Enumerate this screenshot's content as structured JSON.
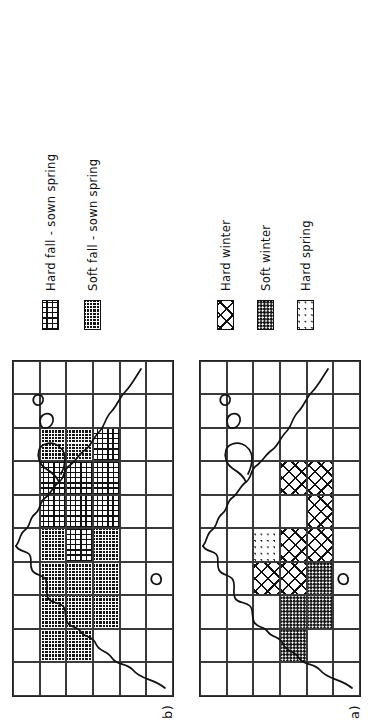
{
  "figure": {
    "orientation": "rotated-90-ccw",
    "panels": [
      {
        "id": "b",
        "label": "b)",
        "legend": [
          {
            "key": "hard_fall_sown_spring",
            "label": "Hard fall - sown spring",
            "pattern": "fine-grid"
          },
          {
            "key": "soft_fall_sown_spring",
            "label": "Soft fall - sown spring",
            "pattern": "dark-fine-grid"
          }
        ],
        "map": {
          "cols": 6,
          "rows": 10,
          "cells": [
            [
              "blank",
              "blank",
              "blank",
              "blank",
              "blank",
              "blank"
            ],
            [
              "blank",
              "soft_fall_sown_spring",
              "soft_fall_sown_spring",
              "blank",
              "blank",
              "blank"
            ],
            [
              "blank",
              "soft_fall_sown_spring",
              "soft_fall_sown_spring",
              "soft_fall_sown_spring",
              "blank",
              "blank"
            ],
            [
              "blank",
              "soft_fall_sown_spring",
              "soft_fall_sown_spring",
              "soft_fall_sown_spring",
              "blank",
              "blank"
            ],
            [
              "blank",
              "soft_fall_sown_spring",
              "hard_fall_sown_spring",
              "soft_fall_sown_spring",
              "blank",
              "blank"
            ],
            [
              "blank",
              "hard_fall_sown_spring",
              "hard_fall_sown_spring",
              "hard_fall_sown_spring",
              "blank",
              "blank"
            ],
            [
              "blank",
              "hard_fall_sown_spring",
              "hard_fall_sown_spring",
              "hard_fall_sown_spring",
              "blank",
              "blank"
            ],
            [
              "blank",
              "soft_fall_sown_spring",
              "soft_fall_sown_spring",
              "hard_fall_sown_spring",
              "blank",
              "blank"
            ],
            [
              "blank",
              "blank",
              "blank",
              "blank",
              "blank",
              "blank"
            ],
            [
              "blank",
              "blank",
              "blank",
              "blank",
              "blank",
              "blank"
            ]
          ]
        }
      },
      {
        "id": "a",
        "label": "a)",
        "legend": [
          {
            "key": "hard_winter",
            "label": "Hard winter",
            "pattern": "diagonal-cross"
          },
          {
            "key": "soft_winter",
            "label": "Soft winter",
            "pattern": "dark-stipple"
          },
          {
            "key": "hard_spring",
            "label": "Hard spring",
            "pattern": "light-stipple"
          }
        ],
        "map": {
          "cols": 6,
          "rows": 10,
          "cells": [
            [
              "blank",
              "blank",
              "blank",
              "blank",
              "blank",
              "blank"
            ],
            [
              "blank",
              "blank",
              "blank",
              "soft_winter",
              "blank",
              "blank"
            ],
            [
              "blank",
              "blank",
              "blank",
              "soft_winter",
              "soft_winter",
              "blank"
            ],
            [
              "blank",
              "blank",
              "hard_winter",
              "hard_winter",
              "soft_winter",
              "blank"
            ],
            [
              "blank",
              "blank",
              "hard_spring",
              "hard_winter",
              "hard_winter",
              "blank"
            ],
            [
              "blank",
              "blank",
              "blank",
              "blank",
              "hard_winter",
              "blank"
            ],
            [
              "blank",
              "blank",
              "blank",
              "hard_winter",
              "hard_winter",
              "blank"
            ],
            [
              "blank",
              "blank",
              "blank",
              "blank",
              "blank",
              "blank"
            ],
            [
              "blank",
              "blank",
              "blank",
              "blank",
              "blank",
              "blank"
            ],
            [
              "blank",
              "blank",
              "blank",
              "blank",
              "blank",
              "blank"
            ]
          ]
        }
      }
    ]
  },
  "chart_data": {
    "type": "map",
    "title": "",
    "panels": [
      {
        "panel": "b",
        "categories": [
          "Hard fall - sown spring",
          "Soft fall - sown spring"
        ],
        "grid": {
          "cols": 6,
          "rows": 10
        }
      },
      {
        "panel": "a",
        "categories": [
          "Hard winter",
          "Soft winter",
          "Hard spring"
        ],
        "grid": {
          "cols": 6,
          "rows": 10
        }
      }
    ],
    "legend_position": "below-map (rotated)",
    "grid": true
  }
}
